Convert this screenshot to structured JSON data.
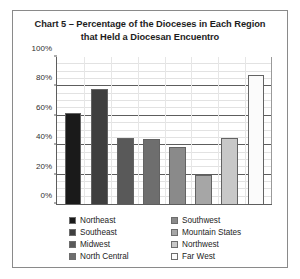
{
  "figure": {
    "title": "Chart 5 – Percentage of the Dioceses in Each Region that Held a Diocesan Encuentro",
    "title_line1": "Chart 5 – Percentage of the Dioceses in Each Region",
    "title_line2": "that Held a Diocesan Encuentro",
    "border_color": "#8a8a8a",
    "background": "#ffffff"
  },
  "chart_data": {
    "type": "bar",
    "title": "Chart 5 – Percentage of the Dioceses in Each Region that Held a Diocesan Encuentro",
    "xlabel": "",
    "ylabel": "",
    "ylim": [
      0,
      100
    ],
    "yticks": [
      0,
      20,
      40,
      60,
      80,
      100
    ],
    "ytick_labels": [
      "0%",
      "20%",
      "40%",
      "60%",
      "80%",
      "100%"
    ],
    "grid": true,
    "legend_position": "bottom",
    "categories": [
      "Northeast",
      "Southeast",
      "Midwest",
      "North Central",
      "Southwest",
      "Mountain States",
      "Northwest",
      "Far West"
    ],
    "values": [
      62,
      78,
      45,
      44,
      39,
      20,
      45,
      88
    ],
    "value_labels": [
      "62%",
      "78%",
      "45%",
      "44%",
      "39%",
      "20%",
      "45%",
      "88%"
    ],
    "colors": [
      "#1a1a1a",
      "#3f3f3f",
      "#595959",
      "#6e6e6e",
      "#8a8a8a",
      "#a6a6a6",
      "#c8c8c8",
      "#fbfbfb"
    ],
    "bar_edge_color": "#636363",
    "series": [
      {
        "name": "Percentage of Dioceses",
        "values": [
          62,
          78,
          45,
          44,
          39,
          20,
          45,
          88
        ]
      }
    ]
  },
  "legend": {
    "columns": [
      {
        "items": [
          {
            "label": "Northeast",
            "color": "#1a1a1a"
          },
          {
            "label": "Southeast",
            "color": "#3f3f3f"
          },
          {
            "label": "Midwest",
            "color": "#595959"
          },
          {
            "label": "North Central",
            "color": "#6e6e6e"
          }
        ]
      },
      {
        "items": [
          {
            "label": "Southwest",
            "color": "#8a8a8a"
          },
          {
            "label": "Mountain States",
            "color": "#a6a6a6"
          },
          {
            "label": "Northwest",
            "color": "#c8c8c8"
          },
          {
            "label": "Far West",
            "color": "#fbfbfb"
          }
        ]
      }
    ]
  }
}
